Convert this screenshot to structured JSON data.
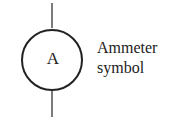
{
  "diagram": {
    "symbol_letter": "A",
    "label_line1": "Ammeter",
    "label_line2": "symbol",
    "stroke_color": "#222222"
  }
}
